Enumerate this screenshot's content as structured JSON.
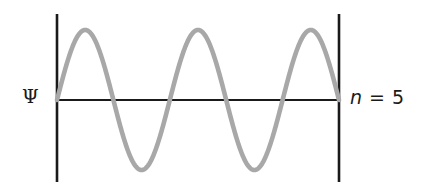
{
  "figure": {
    "background_color": "#ffffff",
    "wave_color": "#a8a8a8",
    "line_color": "#1a1a1a"
  },
  "labels": {
    "psi": "Ψ",
    "mode_variable": "n",
    "mode_equals": "=",
    "mode_value": "5",
    "mode_full": "n = 5"
  },
  "chart_data": {
    "type": "line",
    "title": "",
    "subtitle": "",
    "xlabel": "",
    "ylabel": "Ψ",
    "annotations": [
      "Ψ",
      "n = 5"
    ],
    "legend": [],
    "legend_position": "none",
    "grid": false,
    "xlim": [
      0,
      1
    ],
    "ylim": [
      -1.15,
      1.15
    ],
    "axis_line_y": 0,
    "boundary_walls_x": [
      0,
      1
    ],
    "series": [
      {
        "name": "Ψ n=5",
        "function": "sin(5*pi*x)",
        "color": "#a8a8a8",
        "n": 5,
        "wavelengths": 2.5,
        "amplitude": 1,
        "nodes_x": [
          0,
          0.2,
          0.4,
          0.6,
          0.8,
          1
        ],
        "crests_x": [
          0.1,
          0.5,
          0.9
        ],
        "troughs_x": [
          0.3,
          0.7
        ],
        "x": [
          0,
          0.05,
          0.1,
          0.15,
          0.2,
          0.25,
          0.3,
          0.35,
          0.4,
          0.45,
          0.5,
          0.55,
          0.6,
          0.65,
          0.7,
          0.75,
          0.8,
          0.85,
          0.9,
          0.95,
          1
        ],
        "values": [
          0,
          0.707,
          1,
          0.707,
          0,
          -0.707,
          -1,
          -0.707,
          0,
          0.707,
          1,
          0.707,
          0,
          -0.707,
          -1,
          -0.707,
          0,
          0.707,
          1,
          0.707,
          0
        ]
      }
    ]
  }
}
